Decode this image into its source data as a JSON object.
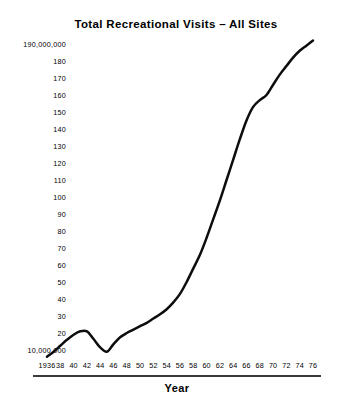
{
  "chart_data": {
    "type": "line",
    "title": "Total Recreational Visits – All Sites",
    "xlabel": "Year",
    "ylabel": "",
    "grid": false,
    "legend": false,
    "xlim": [
      1935,
      1977
    ],
    "ylim": [
      5000000,
      195000000
    ],
    "y_tick_labels": [
      "190,000,000",
      "180",
      "170",
      "160",
      "150",
      "140",
      "130",
      "120",
      "110",
      "100",
      "90",
      "80",
      "70",
      "60",
      "50",
      "40",
      "30",
      "20",
      "10,000,000"
    ],
    "y_tick_values": [
      190000000,
      180000000,
      170000000,
      160000000,
      150000000,
      140000000,
      130000000,
      120000000,
      110000000,
      100000000,
      90000000,
      80000000,
      70000000,
      60000000,
      50000000,
      40000000,
      30000000,
      20000000,
      10000000
    ],
    "x_tick_labels": [
      "1936",
      "38",
      "40",
      "42",
      "44",
      "46",
      "48",
      "50",
      "52",
      "54",
      "56",
      "58",
      "60",
      "62",
      "64",
      "66",
      "68",
      "70",
      "72",
      "74",
      "76"
    ],
    "x_tick_values": [
      1936,
      1938,
      1940,
      1942,
      1944,
      1946,
      1948,
      1950,
      1952,
      1954,
      1956,
      1958,
      1960,
      1962,
      1964,
      1966,
      1968,
      1970,
      1972,
      1974,
      1976
    ],
    "series": [
      {
        "name": "Total Recreational Visits – All Sites",
        "color": "#0d0d0d",
        "x": [
          1936,
          1937,
          1938,
          1939,
          1940,
          1941,
          1942,
          1943,
          1944,
          1945,
          1946,
          1947,
          1948,
          1949,
          1950,
          1951,
          1952,
          1953,
          1954,
          1955,
          1956,
          1957,
          1958,
          1959,
          1960,
          1961,
          1962,
          1963,
          1964,
          1965,
          1966,
          1967,
          1968,
          1969,
          1970,
          1971,
          1972,
          1973,
          1974,
          1975,
          1976
        ],
        "values": [
          6000000,
          9000000,
          12500000,
          16000000,
          19000000,
          21000000,
          21000000,
          16500000,
          11500000,
          9000000,
          13500000,
          17500000,
          20000000,
          22000000,
          24000000,
          26000000,
          28500000,
          31000000,
          34000000,
          38000000,
          43000000,
          50000000,
          58000000,
          66000000,
          76000000,
          87000000,
          98000000,
          110000000,
          122000000,
          134000000,
          145000000,
          153000000,
          157000000,
          160000000,
          166000000,
          172000000,
          177000000,
          182000000,
          186000000,
          189000000,
          192000000
        ]
      }
    ],
    "annotations": []
  }
}
